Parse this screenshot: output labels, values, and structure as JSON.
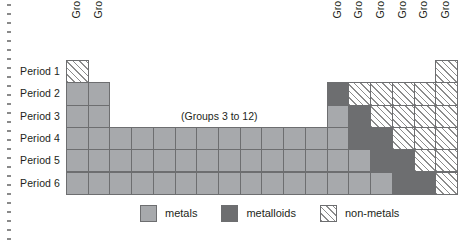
{
  "figure": {
    "caption_center": "(Groups 3 to 12)",
    "margin_rule": "dotted-vertical-rule"
  },
  "axes": {
    "group_labels": [
      "Group 1",
      "Group 2",
      "Group 13",
      "Group 14",
      "Group 15",
      "Group 16",
      "Group 17",
      "Group 18"
    ],
    "period_labels": [
      "Period 1",
      "Period 2",
      "Period 3",
      "Period 4",
      "Period 5",
      "Period 6"
    ]
  },
  "legend": {
    "items": [
      {
        "label": "metals",
        "key": "metals",
        "color": "#a7a9ac"
      },
      {
        "label": "metalloids",
        "key": "metalloids",
        "color": "#6d6e70"
      },
      {
        "label": "non-metals",
        "key": "nonmetals",
        "color": "#ffffff"
      }
    ]
  },
  "chart_data": {
    "type": "heatmap",
    "xlabel": "Group",
    "ylabel": "Period",
    "categories_x": [
      "Group 1",
      "Group 2",
      "Groups 3 to 12",
      "Group 13",
      "Group 14",
      "Group 15",
      "Group 16",
      "Group 17",
      "Group 18"
    ],
    "categories_y": [
      "Period 1",
      "Period 2",
      "Period 3",
      "Period 4",
      "Period 5",
      "Period 6"
    ],
    "categories_values": [
      "metals",
      "metalloids",
      "nonmetals"
    ],
    "grid": true,
    "legend_position": "bottom-center",
    "cells": [
      {
        "period": "Period 1",
        "group": "Group 1",
        "col": 1,
        "row": 1,
        "class": "nonmetals"
      },
      {
        "period": "Period 1",
        "group": "Group 18",
        "col": 18,
        "row": 1,
        "class": "nonmetals"
      },
      {
        "period": "Period 2",
        "group": "Group 1",
        "col": 1,
        "row": 2,
        "class": "metals"
      },
      {
        "period": "Period 2",
        "group": "Group 2",
        "col": 2,
        "row": 2,
        "class": "metals"
      },
      {
        "period": "Period 2",
        "group": "Group 13",
        "col": 13,
        "row": 2,
        "class": "metalloids"
      },
      {
        "period": "Period 2",
        "group": "Group 14",
        "col": 14,
        "row": 2,
        "class": "nonmetals"
      },
      {
        "period": "Period 2",
        "group": "Group 15",
        "col": 15,
        "row": 2,
        "class": "nonmetals"
      },
      {
        "period": "Period 2",
        "group": "Group 16",
        "col": 16,
        "row": 2,
        "class": "nonmetals"
      },
      {
        "period": "Period 2",
        "group": "Group 17",
        "col": 17,
        "row": 2,
        "class": "nonmetals"
      },
      {
        "period": "Period 2",
        "group": "Group 18",
        "col": 18,
        "row": 2,
        "class": "nonmetals"
      },
      {
        "period": "Period 3",
        "group": "Group 1",
        "col": 1,
        "row": 3,
        "class": "metals"
      },
      {
        "period": "Period 3",
        "group": "Group 2",
        "col": 2,
        "row": 3,
        "class": "metals"
      },
      {
        "period": "Period 3",
        "group": "Group 13",
        "col": 13,
        "row": 3,
        "class": "metals"
      },
      {
        "period": "Period 3",
        "group": "Group 14",
        "col": 14,
        "row": 3,
        "class": "metalloids"
      },
      {
        "period": "Period 3",
        "group": "Group 15",
        "col": 15,
        "row": 3,
        "class": "nonmetals"
      },
      {
        "period": "Period 3",
        "group": "Group 16",
        "col": 16,
        "row": 3,
        "class": "nonmetals"
      },
      {
        "period": "Period 3",
        "group": "Group 17",
        "col": 17,
        "row": 3,
        "class": "nonmetals"
      },
      {
        "period": "Period 3",
        "group": "Group 18",
        "col": 18,
        "row": 3,
        "class": "nonmetals"
      },
      {
        "period": "Period 4",
        "group": "Group 1",
        "col": 1,
        "row": 4,
        "class": "metals"
      },
      {
        "period": "Period 4",
        "group": "Group 2",
        "col": 2,
        "row": 4,
        "class": "metals"
      },
      {
        "period": "Period 4",
        "group": "Group 3",
        "col": 3,
        "row": 4,
        "class": "metals"
      },
      {
        "period": "Period 4",
        "group": "Group 4",
        "col": 4,
        "row": 4,
        "class": "metals"
      },
      {
        "period": "Period 4",
        "group": "Group 5",
        "col": 5,
        "row": 4,
        "class": "metals"
      },
      {
        "period": "Period 4",
        "group": "Group 6",
        "col": 6,
        "row": 4,
        "class": "metals"
      },
      {
        "period": "Period 4",
        "group": "Group 7",
        "col": 7,
        "row": 4,
        "class": "metals"
      },
      {
        "period": "Period 4",
        "group": "Group 8",
        "col": 8,
        "row": 4,
        "class": "metals"
      },
      {
        "period": "Period 4",
        "group": "Group 9",
        "col": 9,
        "row": 4,
        "class": "metals"
      },
      {
        "period": "Period 4",
        "group": "Group 10",
        "col": 10,
        "row": 4,
        "class": "metals"
      },
      {
        "period": "Period 4",
        "group": "Group 11",
        "col": 11,
        "row": 4,
        "class": "metals"
      },
      {
        "period": "Period 4",
        "group": "Group 12",
        "col": 12,
        "row": 4,
        "class": "metals"
      },
      {
        "period": "Period 4",
        "group": "Group 13",
        "col": 13,
        "row": 4,
        "class": "metals"
      },
      {
        "period": "Period 4",
        "group": "Group 14",
        "col": 14,
        "row": 4,
        "class": "metalloids"
      },
      {
        "period": "Period 4",
        "group": "Group 15",
        "col": 15,
        "row": 4,
        "class": "metalloids"
      },
      {
        "period": "Period 4",
        "group": "Group 16",
        "col": 16,
        "row": 4,
        "class": "nonmetals"
      },
      {
        "period": "Period 4",
        "group": "Group 17",
        "col": 17,
        "row": 4,
        "class": "nonmetals"
      },
      {
        "period": "Period 4",
        "group": "Group 18",
        "col": 18,
        "row": 4,
        "class": "nonmetals"
      },
      {
        "period": "Period 5",
        "group": "Group 1",
        "col": 1,
        "row": 5,
        "class": "metals"
      },
      {
        "period": "Period 5",
        "group": "Group 2",
        "col": 2,
        "row": 5,
        "class": "metals"
      },
      {
        "period": "Period 5",
        "group": "Group 3",
        "col": 3,
        "row": 5,
        "class": "metals"
      },
      {
        "period": "Period 5",
        "group": "Group 4",
        "col": 4,
        "row": 5,
        "class": "metals"
      },
      {
        "period": "Period 5",
        "group": "Group 5",
        "col": 5,
        "row": 5,
        "class": "metals"
      },
      {
        "period": "Period 5",
        "group": "Group 6",
        "col": 6,
        "row": 5,
        "class": "metals"
      },
      {
        "period": "Period 5",
        "group": "Group 7",
        "col": 7,
        "row": 5,
        "class": "metals"
      },
      {
        "period": "Period 5",
        "group": "Group 8",
        "col": 8,
        "row": 5,
        "class": "metals"
      },
      {
        "period": "Period 5",
        "group": "Group 9",
        "col": 9,
        "row": 5,
        "class": "metals"
      },
      {
        "period": "Period 5",
        "group": "Group 10",
        "col": 10,
        "row": 5,
        "class": "metals"
      },
      {
        "period": "Period 5",
        "group": "Group 11",
        "col": 11,
        "row": 5,
        "class": "metals"
      },
      {
        "period": "Period 5",
        "group": "Group 12",
        "col": 12,
        "row": 5,
        "class": "metals"
      },
      {
        "period": "Period 5",
        "group": "Group 13",
        "col": 13,
        "row": 5,
        "class": "metals"
      },
      {
        "period": "Period 5",
        "group": "Group 14",
        "col": 14,
        "row": 5,
        "class": "metals"
      },
      {
        "period": "Period 5",
        "group": "Group 15",
        "col": 15,
        "row": 5,
        "class": "metalloids"
      },
      {
        "period": "Period 5",
        "group": "Group 16",
        "col": 16,
        "row": 5,
        "class": "metalloids"
      },
      {
        "period": "Period 5",
        "group": "Group 17",
        "col": 17,
        "row": 5,
        "class": "nonmetals"
      },
      {
        "period": "Period 5",
        "group": "Group 18",
        "col": 18,
        "row": 5,
        "class": "nonmetals"
      },
      {
        "period": "Period 6",
        "group": "Group 1",
        "col": 1,
        "row": 6,
        "class": "metals"
      },
      {
        "period": "Period 6",
        "group": "Group 2",
        "col": 2,
        "row": 6,
        "class": "metals"
      },
      {
        "period": "Period 6",
        "group": "Group 3",
        "col": 3,
        "row": 6,
        "class": "metals"
      },
      {
        "period": "Period 6",
        "group": "Group 4",
        "col": 4,
        "row": 6,
        "class": "metals"
      },
      {
        "period": "Period 6",
        "group": "Group 5",
        "col": 5,
        "row": 6,
        "class": "metals"
      },
      {
        "period": "Period 6",
        "group": "Group 6",
        "col": 6,
        "row": 6,
        "class": "metals"
      },
      {
        "period": "Period 6",
        "group": "Group 7",
        "col": 7,
        "row": 6,
        "class": "metals"
      },
      {
        "period": "Period 6",
        "group": "Group 8",
        "col": 8,
        "row": 6,
        "class": "metals"
      },
      {
        "period": "Period 6",
        "group": "Group 9",
        "col": 9,
        "row": 6,
        "class": "metals"
      },
      {
        "period": "Period 6",
        "group": "Group 10",
        "col": 10,
        "row": 6,
        "class": "metals"
      },
      {
        "period": "Period 6",
        "group": "Group 11",
        "col": 11,
        "row": 6,
        "class": "metals"
      },
      {
        "period": "Period 6",
        "group": "Group 12",
        "col": 12,
        "row": 6,
        "class": "metals"
      },
      {
        "period": "Period 6",
        "group": "Group 13",
        "col": 13,
        "row": 6,
        "class": "metals"
      },
      {
        "period": "Period 6",
        "group": "Group 14",
        "col": 14,
        "row": 6,
        "class": "metals"
      },
      {
        "period": "Period 6",
        "group": "Group 15",
        "col": 15,
        "row": 6,
        "class": "metals"
      },
      {
        "period": "Period 6",
        "group": "Group 16",
        "col": 16,
        "row": 6,
        "class": "metalloids"
      },
      {
        "period": "Period 6",
        "group": "Group 17",
        "col": 17,
        "row": 6,
        "class": "metalloids"
      },
      {
        "period": "Period 6",
        "group": "Group 18",
        "col": 18,
        "row": 6,
        "class": "nonmetals"
      }
    ]
  }
}
